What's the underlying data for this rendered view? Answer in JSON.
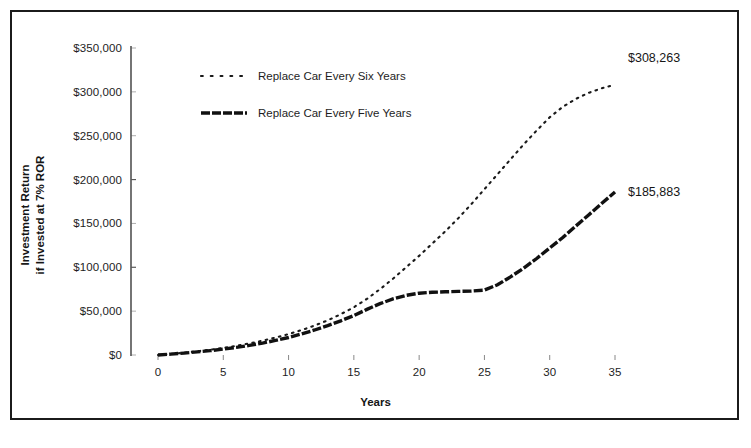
{
  "chart_data": {
    "type": "line",
    "title": "",
    "xlabel": "Years",
    "ylabel_line1": "Investment Return",
    "ylabel_line2": "if Invested at 7% ROR",
    "xlim": [
      0,
      35
    ],
    "ylim": [
      0,
      350000
    ],
    "grid": false,
    "legend_position": "upper-left-inside",
    "x_ticks": [
      "0",
      "5",
      "10",
      "15",
      "20",
      "25",
      "30",
      "35"
    ],
    "x_tick_values": [
      0,
      5,
      10,
      15,
      20,
      25,
      30,
      35
    ],
    "y_ticks": [
      "$0",
      "$50,000",
      "$100,000",
      "$150,000",
      "$200,000",
      "$250,000",
      "$300,000",
      "$350,000"
    ],
    "y_tick_values": [
      0,
      50000,
      100000,
      150000,
      200000,
      250000,
      300000,
      350000
    ],
    "x": [
      0,
      1,
      2,
      3,
      4,
      5,
      6,
      7,
      8,
      9,
      10,
      11,
      12,
      13,
      14,
      15,
      16,
      17,
      18,
      19,
      20,
      21,
      22,
      23,
      24,
      25,
      26,
      27,
      28,
      29,
      30,
      31,
      32,
      33,
      34,
      35
    ],
    "series": [
      {
        "name": "Replace Car Every Six Years",
        "style": "dotted",
        "color": "#1a1a1a",
        "end_label": "$308,263",
        "end_value": 308263,
        "values": [
          0,
          1200,
          2600,
          4200,
          6000,
          8000,
          10500,
          13200,
          16300,
          19800,
          23800,
          28400,
          33600,
          39500,
          46500,
          54500,
          64000,
          75000,
          87000,
          100000,
          113000,
          127000,
          141000,
          156000,
          172000,
          189000,
          206000,
          223000,
          240000,
          256000,
          271000,
          283000,
          292000,
          299000,
          304000,
          308263
        ]
      },
      {
        "name": "Replace Car Every Five Years",
        "style": "dashed-thick",
        "color": "#111111",
        "end_label": "$185,883",
        "end_value": 185883,
        "values": [
          0,
          1000,
          2200,
          3500,
          5000,
          6700,
          8700,
          11000,
          13600,
          16600,
          20000,
          24000,
          28500,
          33500,
          39000,
          45000,
          52000,
          58500,
          64000,
          68000,
          70500,
          71500,
          72000,
          72500,
          73000,
          74000,
          80000,
          89000,
          99000,
          110000,
          122000,
          134000,
          147000,
          160000,
          173000,
          185883
        ]
      }
    ],
    "legend": [
      {
        "label": "Replace Car Every Six Years",
        "style": "dotted"
      },
      {
        "label": "Replace Car Every Five Years",
        "style": "dashed-thick"
      }
    ],
    "annotations": [
      {
        "text": "$308,263",
        "x": 35,
        "y": 308263
      },
      {
        "text": "$185,883",
        "x": 35,
        "y": 185883
      }
    ]
  }
}
